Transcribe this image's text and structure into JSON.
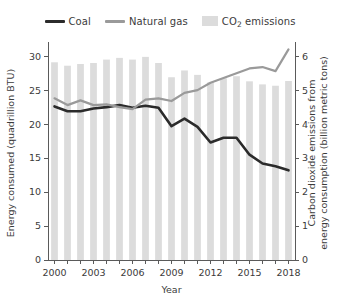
{
  "legend": {
    "position": "top-center",
    "entries": [
      {
        "label": "Coal",
        "marker": "line",
        "color": "#2b2b2b"
      },
      {
        "label": "Natural gas",
        "marker": "line",
        "color": "#9a9a9a"
      },
      {
        "label": "CO2 emissions",
        "label_main": "CO",
        "label_sub": "2",
        "label_tail": " emissions",
        "marker": "bar",
        "color": "#dcdcdc"
      }
    ]
  },
  "chart_data": {
    "type": "bar",
    "title": "",
    "subtitle": "",
    "xlabel": "Year",
    "ylabel": "Energy consumed (quadrillion BTU)",
    "y2label": "Carbon dioxide emissions from energy consumption (billion metric tons)",
    "grid": false,
    "x": [
      2000,
      2001,
      2002,
      2003,
      2004,
      2005,
      2006,
      2007,
      2008,
      2009,
      2010,
      2011,
      2012,
      2013,
      2014,
      2015,
      2016,
      2017,
      2018
    ],
    "categories": [
      "2000",
      "2001",
      "2002",
      "2003",
      "2004",
      "2005",
      "2006",
      "2007",
      "2008",
      "2009",
      "2010",
      "2011",
      "2012",
      "2013",
      "2014",
      "2015",
      "2016",
      "2017",
      "2018"
    ],
    "xlim": [
      1999.5,
      2018.5
    ],
    "xticks": [
      2000,
      2001,
      2002,
      2003,
      2004,
      2005,
      2006,
      2007,
      2008,
      2009,
      2010,
      2011,
      2012,
      2013,
      2014,
      2015,
      2016,
      2017,
      2018
    ],
    "xticklabels": [
      "2000",
      "",
      "",
      "2003",
      "",
      "",
      "2006",
      "",
      "",
      "2009",
      "",
      "",
      "2012",
      "",
      "",
      "2015",
      "",
      "",
      "2018"
    ],
    "ylim": [
      0,
      31.5
    ],
    "yticks": [
      0,
      5,
      10,
      15,
      20,
      25,
      30
    ],
    "yticklabels": [
      "0",
      "5",
      "10",
      "15",
      "20",
      "25",
      "30"
    ],
    "y2lim": [
      0,
      6.3
    ],
    "y2ticks": [
      0,
      1,
      2,
      3,
      4,
      5,
      6
    ],
    "y2ticklabels": [
      "0",
      "1",
      "2",
      "3",
      "4",
      "5",
      "6"
    ],
    "series": [
      {
        "name": "CO2 emissions",
        "type": "bar",
        "axis": "right",
        "color": "#dcdcdc",
        "values": [
          5.82,
          5.72,
          5.77,
          5.8,
          5.9,
          5.95,
          5.9,
          5.98,
          5.8,
          5.38,
          5.58,
          5.45,
          5.23,
          5.35,
          5.41,
          5.26,
          5.17,
          5.13,
          5.27
        ]
      },
      {
        "name": "Coal",
        "type": "line",
        "axis": "left",
        "color": "#2b2b2b",
        "values": [
          22.6,
          21.9,
          21.9,
          22.3,
          22.5,
          22.8,
          22.4,
          22.7,
          22.4,
          19.7,
          20.8,
          19.6,
          17.3,
          18.0,
          18.0,
          15.5,
          14.2,
          13.8,
          13.2
        ]
      },
      {
        "name": "Natural gas",
        "type": "line",
        "axis": "left",
        "color": "#9a9a9a",
        "values": [
          23.8,
          22.8,
          23.5,
          22.8,
          22.9,
          22.5,
          22.2,
          23.6,
          23.8,
          23.4,
          24.6,
          25.0,
          26.1,
          26.8,
          27.5,
          28.2,
          28.4,
          27.8,
          31.0
        ]
      }
    ]
  }
}
